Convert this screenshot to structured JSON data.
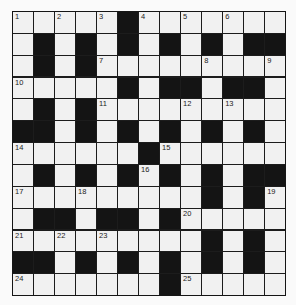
{
  "puzzle": {
    "rows": 13,
    "cols": 13,
    "colors": {
      "white_cell": "#f1f1f1",
      "black_cell": "#141414",
      "grid_line": "#1c1c1c",
      "number_text": "#222222"
    },
    "layout": [
      "WWWWWBWWWWWWW",
      "WBWBWBWBWBWBB",
      "WBWBWWWWWWWWW",
      "WWWWWBWBBWBBW",
      "WBWBWWWWWWWWW",
      "BBWBWBWBWBWBW",
      "WWWWWWBWWWWWW",
      "WBWBWBWBWBWBB",
      "WWWWWWWWWBWBW",
      "WBBWBBWBWWWWW",
      "WWWWWWWWWBWBW",
      "BBWBWBWBWBWBW",
      "WWWWWWWBWWWWW"
    ],
    "numbers": [
      {
        "row": 0,
        "col": 0,
        "n": "1"
      },
      {
        "row": 0,
        "col": 2,
        "n": "2"
      },
      {
        "row": 0,
        "col": 4,
        "n": "3"
      },
      {
        "row": 0,
        "col": 6,
        "n": "4"
      },
      {
        "row": 0,
        "col": 8,
        "n": "5"
      },
      {
        "row": 0,
        "col": 10,
        "n": "6"
      },
      {
        "row": 2,
        "col": 4,
        "n": "7"
      },
      {
        "row": 2,
        "col": 9,
        "n": "8"
      },
      {
        "row": 2,
        "col": 12,
        "n": "9"
      },
      {
        "row": 3,
        "col": 0,
        "n": "10"
      },
      {
        "row": 4,
        "col": 4,
        "n": "11"
      },
      {
        "row": 4,
        "col": 8,
        "n": "12"
      },
      {
        "row": 4,
        "col": 10,
        "n": "13"
      },
      {
        "row": 6,
        "col": 0,
        "n": "14"
      },
      {
        "row": 6,
        "col": 7,
        "n": "15"
      },
      {
        "row": 7,
        "col": 6,
        "n": "16"
      },
      {
        "row": 8,
        "col": 0,
        "n": "17"
      },
      {
        "row": 8,
        "col": 3,
        "n": "18"
      },
      {
        "row": 8,
        "col": 12,
        "n": "19"
      },
      {
        "row": 9,
        "col": 8,
        "n": "20"
      },
      {
        "row": 10,
        "col": 0,
        "n": "21"
      },
      {
        "row": 10,
        "col": 2,
        "n": "22"
      },
      {
        "row": 10,
        "col": 4,
        "n": "23"
      },
      {
        "row": 12,
        "col": 0,
        "n": "24"
      },
      {
        "row": 12,
        "col": 8,
        "n": "25"
      }
    ]
  }
}
